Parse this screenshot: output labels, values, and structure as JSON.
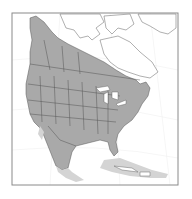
{
  "map": {
    "subject": "North America species range map",
    "regions_shown": [
      "Canada",
      "United States",
      "Mexico",
      "Central America",
      "Caribbean",
      "Greenland"
    ],
    "legend": [
      {
        "label": "Primary range",
        "color": "#a9a9a9"
      },
      {
        "label": "Secondary/peripheral range",
        "color": "#d4d4d4"
      },
      {
        "label": "Outside range",
        "color": "#ffffff"
      }
    ],
    "colors": {
      "frame": "#8a8a8a",
      "border": "#555555",
      "coast": "#7a7a7a",
      "graticule": "#e6e6e6",
      "background": "#ffffff"
    }
  }
}
